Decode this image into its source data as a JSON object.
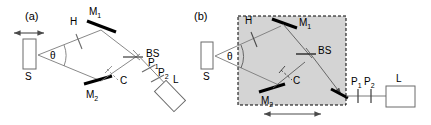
{
  "figure": {
    "type": "optical-setup-diagram",
    "panels": [
      {
        "id": "a",
        "label": "(a)",
        "components": [
          {
            "name": "S",
            "label": "S",
            "role": "source"
          },
          {
            "name": "H",
            "label": "H",
            "role": "half-wave-plate"
          },
          {
            "name": "M1",
            "label": "M",
            "sub": "1",
            "role": "mirror"
          },
          {
            "name": "M2",
            "label": "M",
            "sub": "2",
            "role": "mirror"
          },
          {
            "name": "BS",
            "label": "BS",
            "role": "beam-splitter"
          },
          {
            "name": "C",
            "label": "C",
            "role": "compensator"
          },
          {
            "name": "P1",
            "label": "P",
            "sub": "1",
            "role": "polarizer"
          },
          {
            "name": "P2",
            "label": "P",
            "sub": "2",
            "role": "polarizer"
          },
          {
            "name": "L",
            "label": "L",
            "role": "detector"
          }
        ],
        "angle_label": "θ",
        "arrows": [
          {
            "name": "source-translation-arrow",
            "orientation": "horizontal",
            "heads": "both"
          }
        ]
      },
      {
        "id": "b",
        "label": "(b)",
        "components": [
          {
            "name": "S",
            "label": "S",
            "role": "source"
          },
          {
            "name": "H",
            "label": "H",
            "role": "half-wave-plate"
          },
          {
            "name": "M1",
            "label": "M",
            "sub": "1",
            "role": "mirror"
          },
          {
            "name": "M2",
            "label": "M",
            "sub": "2",
            "role": "mirror"
          },
          {
            "name": "BS",
            "label": "BS",
            "role": "beam-splitter"
          },
          {
            "name": "C",
            "label": "C",
            "role": "compensator"
          },
          {
            "name": "P1",
            "label": "P",
            "sub": "1",
            "role": "polarizer"
          },
          {
            "name": "P2",
            "label": "P",
            "sub": "2",
            "role": "polarizer"
          },
          {
            "name": "L",
            "label": "L",
            "role": "detector"
          }
        ],
        "angle_label": "θ",
        "enclosure": {
          "name": "translatable-stage",
          "style": "dashed",
          "fill": "#d4d4d4"
        },
        "arrows": [
          {
            "name": "stage-translation-arrow",
            "orientation": "horizontal",
            "heads": "both"
          }
        ]
      }
    ],
    "colors": {
      "stroke": "#000000",
      "ray": "#5a5a5a",
      "mirror": "#000000",
      "enclosure_fill": "#d4d4d4",
      "background": "#ffffff"
    }
  }
}
